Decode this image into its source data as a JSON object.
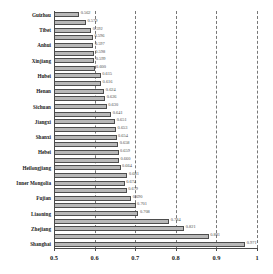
{
  "chart_data": {
    "type": "bar",
    "orientation": "horizontal",
    "title": "",
    "subtitle": "",
    "xlabel": "",
    "ylabel": "",
    "xlim": [
      0.5,
      1.0
    ],
    "grid": true,
    "legend": null,
    "xticks": [
      "0.5",
      "0.6",
      "0.7",
      "0.8",
      "0.9",
      "1"
    ],
    "xtick_values": [
      0.5,
      0.6,
      0.7,
      0.8,
      0.9,
      1.0
    ],
    "categories": [
      "Guizhou",
      "",
      "Tibet",
      "",
      "Anhui",
      "",
      "Xinjiang",
      "",
      "Hubei",
      "",
      "Henan",
      "",
      "Sichuan",
      "",
      "Jiangxi",
      "",
      "Shanxi",
      "",
      "Hebei",
      "",
      "Heilongjiang",
      "",
      "Inner Mongolia",
      "",
      "Fujian",
      "",
      "Liaoning",
      "",
      "Zhejiang",
      "",
      "Shanghai"
    ],
    "tick_labels": [
      "Guizhou",
      "Tibet",
      "Anhui",
      "Xinjiang",
      "Hubei",
      "Henan",
      "Sichuan",
      "Jiangxi",
      "Shanxi",
      "Hebei",
      "Heilongjiang",
      "Inner Mongolia",
      "Fujian",
      "Liaoning",
      "Zhejiang",
      "Shanghai"
    ],
    "values": [
      0.562,
      0.579,
      0.592,
      0.596,
      0.597,
      0.598,
      0.599,
      0.6,
      0.615,
      0.616,
      0.624,
      0.626,
      0.63,
      0.641,
      0.651,
      0.653,
      0.654,
      0.658,
      0.659,
      0.66,
      0.664,
      0.681,
      0.674,
      0.679,
      0.69,
      0.701,
      0.708,
      0.784,
      0.821,
      0.881,
      0.971
    ],
    "value_labels": [
      "0.562",
      "0.579",
      "0.592",
      "0.596",
      "0.597",
      "0.598",
      "0.599",
      "0.600",
      "0.615",
      "0.616",
      "0.624",
      "0.626",
      "0.630",
      "0.641",
      "0.651",
      "0.653",
      "0.654",
      "0.658",
      "0.659",
      "0.660",
      "0.664",
      "0.681",
      "0.674",
      "0.679",
      "0.690",
      "0.701",
      "0.708",
      "0.784",
      "0.821",
      "0.881",
      "0.971"
    ],
    "colors": {
      "bar_fill": "#b8b8b8",
      "bar_edge": "#4d4d4d",
      "grid": "#777777",
      "axis": "#4a4a4a",
      "text": "#1a1a1a",
      "value_text": "#4d4d4d",
      "background": "#ffffff"
    }
  }
}
